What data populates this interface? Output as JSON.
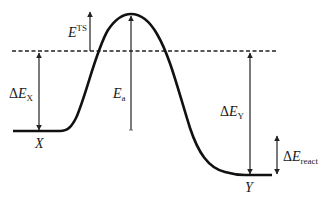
{
  "diagram": {
    "type": "energy-profile",
    "colors": {
      "curve": "#111111",
      "arrow": "#222222",
      "dashed": "#222222",
      "text": "#1a1a1a"
    },
    "labels": {
      "e_ts": {
        "symbol": "E",
        "sup": "TS"
      },
      "delta_e_x": {
        "prefix": "Δ",
        "symbol": "E",
        "sub": "X"
      },
      "e_a": {
        "symbol": "E",
        "sub": "a"
      },
      "delta_e_y": {
        "prefix": "Δ",
        "symbol": "E",
        "sub": "Y"
      },
      "delta_e_react": {
        "prefix": "Δ",
        "symbol": "E",
        "sub": "react"
      },
      "state_x": "X",
      "state_y": "Y"
    }
  }
}
